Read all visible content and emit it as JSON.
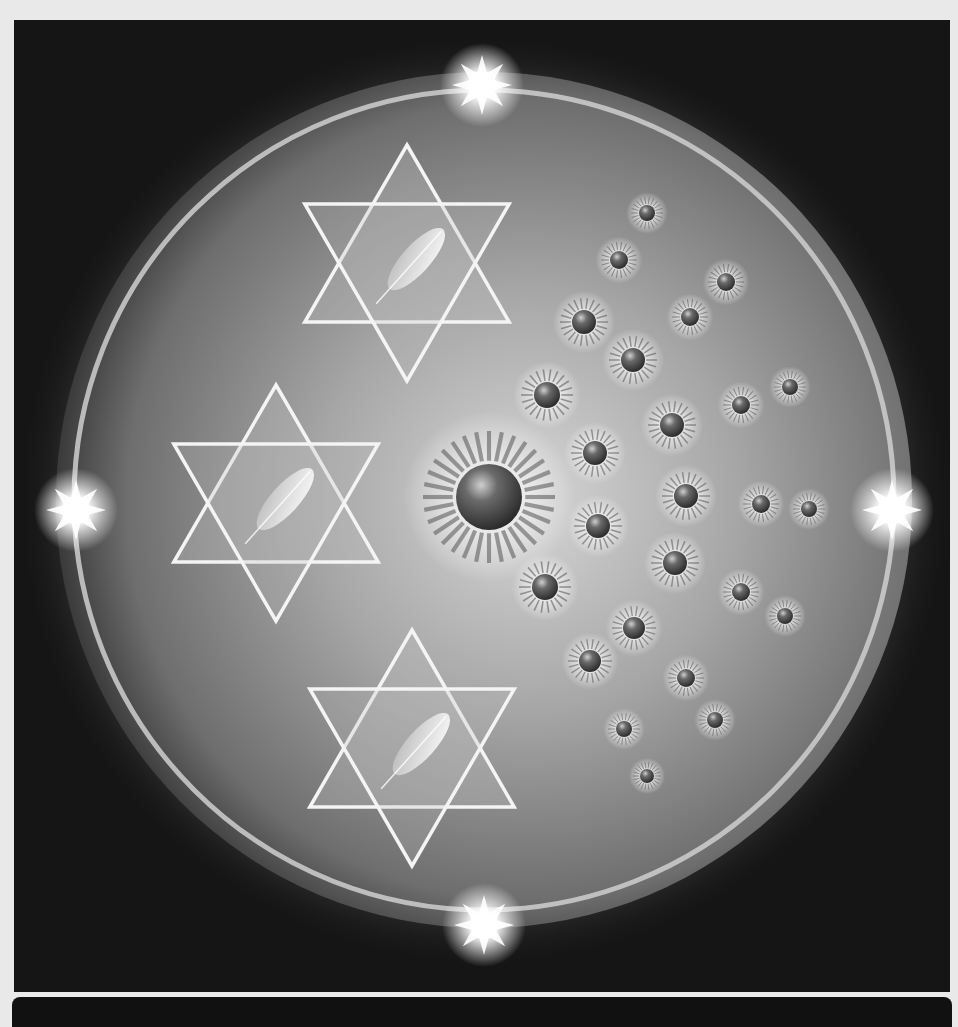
{
  "artwork": {
    "subject": "Mandala with three hexagram stars containing feathers and radiating glowing orbs inside a luminous ring",
    "palette": {
      "background": "#151515",
      "page": "#e9e9e9",
      "ring": "#cfcfcf",
      "glow_center": "#d8d8d8",
      "disc_edge": "#6a6a6a",
      "star_line": "#f4f4f4",
      "orb": "#4a4a4a"
    },
    "stars": [
      {
        "name": "top-hexagram",
        "feather": true
      },
      {
        "name": "middle-hexagram",
        "feather": true
      },
      {
        "name": "bottom-hexagram",
        "feather": true
      }
    ],
    "starbursts": [
      "top",
      "left",
      "right",
      "bottom"
    ],
    "orb_count": 31
  }
}
